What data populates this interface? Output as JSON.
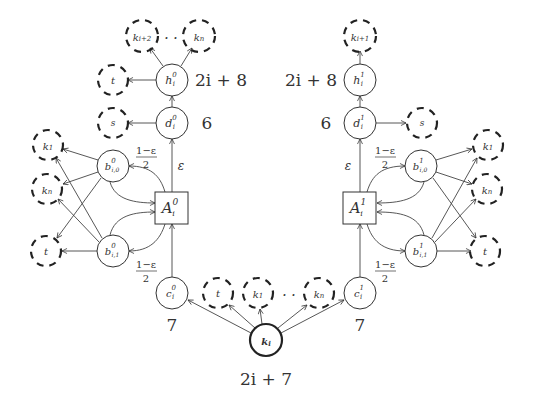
{
  "diagram": {
    "left": {
      "top_targets": [
        "k_{i+2}",
        "k_n"
      ],
      "top_dots": "· ·",
      "h": {
        "label": "h",
        "sup": "0",
        "sub": "i"
      },
      "h_weight": "2i + 8",
      "h_target": "t",
      "d": {
        "label": "d",
        "sup": "0",
        "sub": "i"
      },
      "d_weight": "6",
      "d_target": "s",
      "A": {
        "label": "A",
        "sup": "0",
        "sub": "i"
      },
      "b0": {
        "label": "b",
        "sup": "0",
        "sub": "i,0"
      },
      "b1": {
        "label": "b",
        "sup": "0",
        "sub": "i,1"
      },
      "side_targets": [
        "k1",
        "kn",
        "t"
      ],
      "c": {
        "label": "c",
        "sup": "0",
        "sub": "i"
      },
      "c_weight": "7",
      "eps": "ε",
      "frac_top": "1−ε",
      "frac_bot": "2"
    },
    "right": {
      "top_target": "k_{i+1}",
      "h": {
        "label": "h",
        "sup": "1",
        "sub": "i"
      },
      "h_weight": "2i + 8",
      "d": {
        "label": "d",
        "sup": "1",
        "sub": "i"
      },
      "d_weight": "6",
      "d_target": "s",
      "A": {
        "label": "A",
        "sup": "1",
        "sub": "i"
      },
      "b0": {
        "label": "b",
        "sup": "1",
        "sub": "i,0"
      },
      "b1": {
        "label": "b",
        "sup": "1",
        "sub": "i,1"
      },
      "side_targets": [
        "k1",
        "kn",
        "t"
      ],
      "c": {
        "label": "c",
        "sup": "1",
        "sub": "i"
      },
      "c_weight": "7",
      "eps": "ε",
      "frac_top": "1−ε",
      "frac_bot": "2"
    },
    "bottom": {
      "root": {
        "label": "k",
        "sub": "i"
      },
      "root_weight": "2i + 7",
      "targets": [
        "t",
        "k1",
        "kn"
      ],
      "dots": "· ·"
    }
  }
}
